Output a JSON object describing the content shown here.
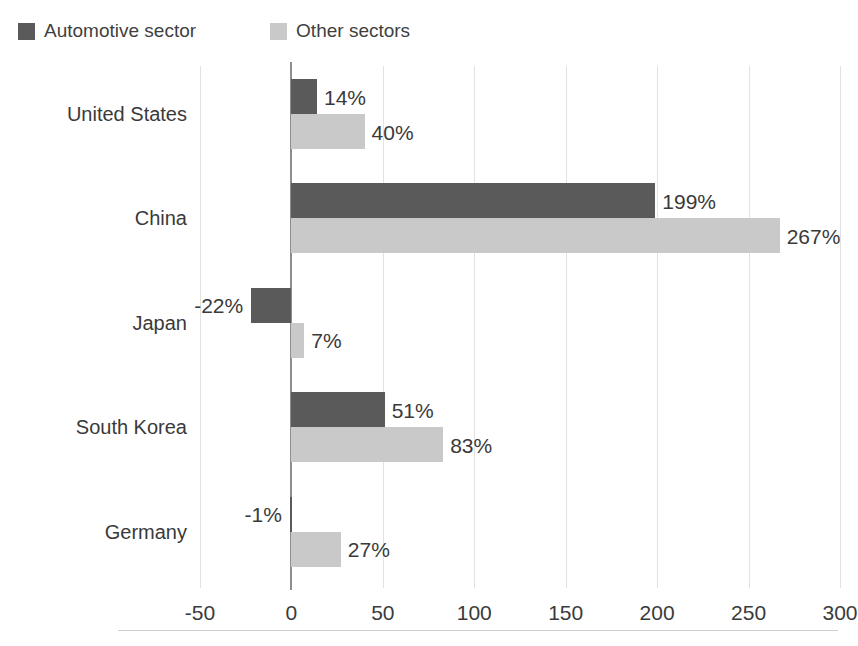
{
  "title_remnant": "",
  "legend": {
    "position": "top-left",
    "items": [
      {
        "label": "Automotive sector",
        "color": "#5a5a5a",
        "swatch_name": "legend-swatch-automotive"
      },
      {
        "label": "Other sectors",
        "color": "#c9c9c9",
        "swatch_name": "legend-swatch-other"
      }
    ]
  },
  "chart_data": {
    "type": "bar",
    "orientation": "horizontal",
    "title": "",
    "subtitle": "",
    "xlabel": "",
    "ylabel": "",
    "categories": [
      "United States",
      "China",
      "Japan",
      "South Korea",
      "Germany"
    ],
    "series": [
      {
        "name": "Automotive sector",
        "color": "#5a5a5a",
        "values": [
          14,
          199,
          -22,
          51,
          -1
        ],
        "labels": [
          "14%",
          "199%",
          "-22%",
          "51%",
          "-1%"
        ]
      },
      {
        "name": "Other sectors",
        "color": "#c9c9c9",
        "values": [
          40,
          267,
          7,
          83,
          27
        ],
        "labels": [
          "40%",
          "267%",
          "7%",
          "83%",
          "27%"
        ]
      }
    ],
    "xlim": [
      -50,
      300
    ],
    "xticks": [
      -50,
      0,
      50,
      100,
      150,
      200,
      250,
      300
    ],
    "xtick_labels": [
      "-50",
      "0",
      "50",
      "100",
      "150",
      "200",
      "250",
      "300"
    ],
    "grid": true,
    "grid_axis": "x",
    "legend_position": "top-left",
    "value_unit": "%"
  }
}
